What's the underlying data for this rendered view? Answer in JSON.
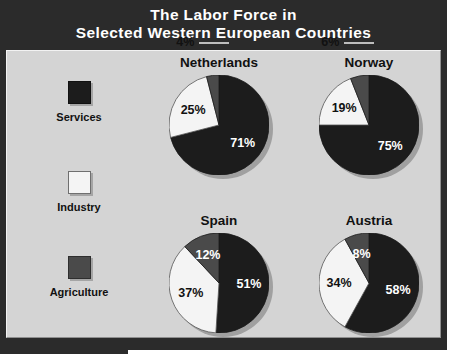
{
  "title": {
    "line1": "The Labor Force in",
    "line2": "Selected Western European Countries"
  },
  "colors": {
    "services": "#1c1c1c",
    "industry": "#f4f4f4",
    "agriculture": "#4a4a4a",
    "banner_bg": "#2b2b2b",
    "panel_bg": "#d4d4d4",
    "text_dark": "#111111",
    "text_light": "#ffffff"
  },
  "legend": {
    "items": [
      {
        "label": "Services",
        "swatch": "services",
        "icon": "square-swatch-dark-icon"
      },
      {
        "label": "Industry",
        "swatch": "industry",
        "icon": "square-swatch-white-icon"
      },
      {
        "label": "Agriculture",
        "swatch": "agriculture",
        "icon": "square-swatch-gray-icon"
      }
    ]
  },
  "chart_data": {
    "type": "pie",
    "title": "The Labor Force in Selected Western European Countries",
    "categories": [
      "Services",
      "Industry",
      "Agriculture"
    ],
    "unit": "%",
    "charts": [
      {
        "name": "Netherlands",
        "slices": [
          {
            "category": "Services",
            "value": 71,
            "label": "71%"
          },
          {
            "category": "Industry",
            "value": 25,
            "label": "25%"
          },
          {
            "category": "Agriculture",
            "value": 4,
            "label": "4%"
          }
        ]
      },
      {
        "name": "Norway",
        "slices": [
          {
            "category": "Services",
            "value": 75,
            "label": "75%"
          },
          {
            "category": "Industry",
            "value": 19,
            "label": "19%"
          },
          {
            "category": "Agriculture",
            "value": 6,
            "label": "6%"
          }
        ]
      },
      {
        "name": "Spain",
        "slices": [
          {
            "category": "Services",
            "value": 51,
            "label": "51%"
          },
          {
            "category": "Industry",
            "value": 37,
            "label": "37%"
          },
          {
            "category": "Agriculture",
            "value": 12,
            "label": "12%"
          }
        ]
      },
      {
        "name": "Austria",
        "slices": [
          {
            "category": "Services",
            "value": 58,
            "label": "58%"
          },
          {
            "category": "Industry",
            "value": 34,
            "label": "34%"
          },
          {
            "category": "Agriculture",
            "value": 8,
            "label": "8%"
          }
        ]
      }
    ]
  }
}
